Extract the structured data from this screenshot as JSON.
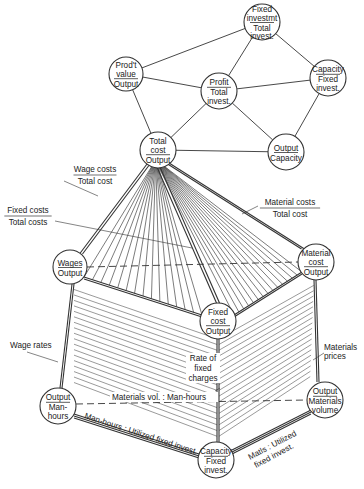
{
  "diagram": {
    "type": "ratio-pyramid",
    "stroke_color": "#333333",
    "background": "#ffffff",
    "nodes": [
      {
        "id": "fixed-invest-total",
        "cx": 262,
        "cy": 22,
        "r": 18,
        "numerator": [
          "Fixed",
          "investmt"
        ],
        "denominator": [
          "Total",
          "invest."
        ]
      },
      {
        "id": "prod-value-output",
        "cx": 126,
        "cy": 74,
        "r": 17,
        "numerator": [
          "Prod't",
          "value"
        ],
        "denominator": [
          "Output"
        ]
      },
      {
        "id": "profit-total-invest",
        "cx": 219,
        "cy": 91,
        "r": 18,
        "numerator": [
          "Profit"
        ],
        "denominator": [
          "Total",
          "invest."
        ]
      },
      {
        "id": "capacity-fixed-invest-top",
        "cx": 328,
        "cy": 78,
        "r": 18,
        "numerator": [
          "Capacity"
        ],
        "denominator": [
          "Fixed",
          "invest."
        ]
      },
      {
        "id": "total-cost-output",
        "cx": 158,
        "cy": 150,
        "r": 18,
        "numerator": [
          "Total",
          "cost"
        ],
        "denominator": [
          "Output"
        ]
      },
      {
        "id": "output-capacity",
        "cx": 286,
        "cy": 152,
        "r": 18,
        "numerator": [
          "Output"
        ],
        "denominator": [
          "Capacity"
        ]
      },
      {
        "id": "wages-output",
        "cx": 70,
        "cy": 267,
        "r": 17,
        "numerator": [
          "Wages"
        ],
        "denominator": [
          "Output"
        ]
      },
      {
        "id": "material-cost-output",
        "cx": 316,
        "cy": 262,
        "r": 18,
        "numerator": [
          "Material",
          "cost"
        ],
        "denominator": [
          "Output"
        ]
      },
      {
        "id": "fixed-cost-output",
        "cx": 218,
        "cy": 321,
        "r": 18,
        "numerator": [
          "Fixed",
          "cost"
        ],
        "denominator": [
          "Output"
        ]
      },
      {
        "id": "output-man-hours",
        "cx": 58,
        "cy": 406,
        "r": 18,
        "numerator": [
          "Output"
        ],
        "denominator": [
          "Man-",
          "hours"
        ]
      },
      {
        "id": "output-materials-volume",
        "cx": 325,
        "cy": 400,
        "r": 18,
        "numerator": [
          "Output"
        ],
        "denominator": [
          "Materials",
          "volume"
        ]
      },
      {
        "id": "capacity-fixed-invest-bottom",
        "cx": 216,
        "cy": 460,
        "r": 18,
        "numerator": [
          "Capacity"
        ],
        "denominator": [
          "Fixed",
          "invest."
        ]
      }
    ],
    "labels": {
      "wage_costs": {
        "numerator": "Wage costs",
        "denominator": "Total cost"
      },
      "fixed_costs": {
        "numerator": "Fixed costs",
        "denominator": "Total costs"
      },
      "material_costs": {
        "numerator": "Material costs",
        "denominator": "Total cost"
      },
      "wage_rates": "Wage rates",
      "materials_prices": [
        "Materials",
        "prices"
      ],
      "rate_of_fixed_charges": [
        "Rate of",
        "fixed",
        "charges"
      ],
      "materials_vol_man_hours": "Materials vol. : Man-hours",
      "man_hours_utilized": "Man-hours : Utilized fixed invest.",
      "matls_utilized": [
        "Matls : Utilized",
        "fixed invest."
      ]
    }
  }
}
